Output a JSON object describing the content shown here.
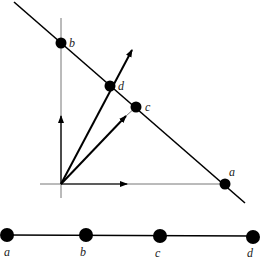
{
  "diagram": {
    "colors": {
      "ink": "#000000",
      "axis": "#777777",
      "label": "#222222"
    },
    "top_figure": {
      "points": [
        {
          "id": "b",
          "label": "b",
          "x": 61,
          "y": 43
        },
        {
          "id": "d",
          "label": "d",
          "x": 110,
          "y": 86
        },
        {
          "id": "c",
          "label": "c",
          "x": 136,
          "y": 107
        },
        {
          "id": "a",
          "label": "a",
          "x": 225,
          "y": 184
        }
      ],
      "line": {
        "x1": 14,
        "y1": 2,
        "x2": 245,
        "y2": 203
      },
      "origin": {
        "x": 61,
        "y": 184
      },
      "vectors": [
        {
          "name": "vector-to-d",
          "x2": 132,
          "y2": 50
        },
        {
          "name": "vector-to-c",
          "x2": 126,
          "y2": 116
        }
      ]
    },
    "bottom_figure": {
      "line_y": 235,
      "points": [
        {
          "id": "a",
          "label": "a",
          "x": 7
        },
        {
          "id": "b",
          "label": "b",
          "x": 86
        },
        {
          "id": "c",
          "label": "c",
          "x": 160
        },
        {
          "id": "d",
          "label": "d",
          "x": 253
        }
      ]
    }
  }
}
